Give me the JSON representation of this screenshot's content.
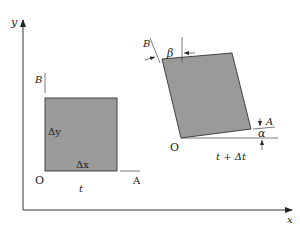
{
  "diagram": {
    "axes": {
      "x_label": "x",
      "y_label": "y"
    },
    "initial_element": {
      "time_label": "t",
      "origin_label": "O",
      "point_a_label": "A",
      "point_b_label": "B",
      "dx_label": "Δx",
      "dy_label": "Δy",
      "fill_color": "#9a9a9a"
    },
    "deformed_element": {
      "time_label": "t + Δt",
      "origin_label": "O",
      "point_a_label": "A",
      "point_b_label": "B",
      "alpha_label": "α",
      "beta_label": "β",
      "fill_color": "#9a9a9a"
    }
  }
}
